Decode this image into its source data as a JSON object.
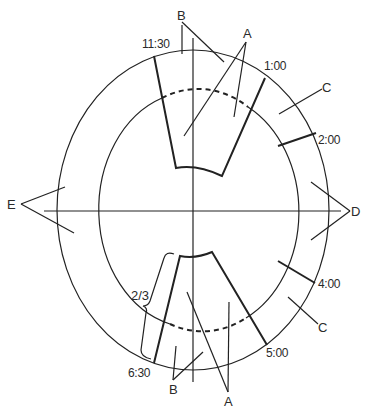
{
  "diagram": {
    "labels": {
      "A_top": "A",
      "B_top": "B",
      "C_top": "C",
      "D": "D",
      "E": "E",
      "C_bottom": "C",
      "B_bottom": "B",
      "A_bottom": "A",
      "fraction": "2/3"
    },
    "clock_positions": {
      "t1130": "11:30",
      "t100": "1:00",
      "t200": "2:00",
      "t400": "4:00",
      "t500": "5:00",
      "t630": "6:30"
    }
  }
}
